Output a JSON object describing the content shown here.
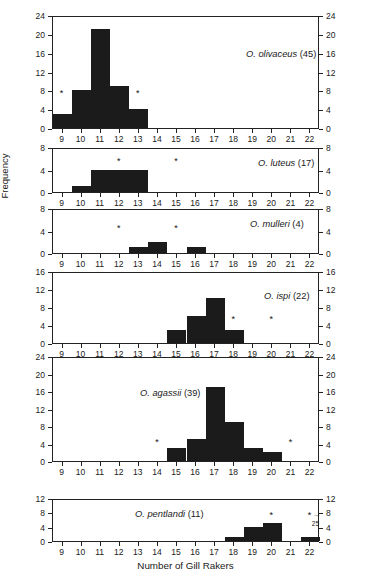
{
  "figure": {
    "xlabel": "Number of Gill Rakers",
    "ylabel": "Frequency"
  },
  "chart_data": {
    "type": "bar",
    "title": "",
    "subtitle": "",
    "xlabel": "Number of Gill Rakers",
    "ylabel": "Frequency",
    "xlim": [
      8.5,
      22.5
    ],
    "x_ticks": [
      9,
      10,
      11,
      12,
      13,
      14,
      15,
      16,
      17,
      18,
      19,
      20,
      21,
      22
    ],
    "grid": false,
    "legend": "none",
    "panel_layout": "6 stacked histogram panels sharing the x-axis; y-axis tick labels mirrored on left and right of each panel",
    "panels": [
      {
        "label": "O. olivaceus",
        "species": "O. olivaceus",
        "n": "(45)",
        "sample_size": 45,
        "ylim": [
          0,
          24
        ],
        "y_ticks": [
          0,
          4,
          8,
          12,
          16,
          20,
          24
        ],
        "categories": [
          9,
          10,
          11,
          12,
          13,
          14,
          15,
          16,
          17,
          18,
          19,
          20,
          21,
          22
        ],
        "values": [
          3,
          8,
          21,
          9,
          4,
          0,
          0,
          0,
          0,
          0,
          0,
          0,
          0,
          0
        ],
        "annotations": [
          {
            "symbol": "*",
            "x": 9,
            "y": 8
          },
          {
            "symbol": "*",
            "x": 13,
            "y": 8
          }
        ]
      },
      {
        "label": "O. luteus",
        "species": "O. luteus",
        "n": "(17)",
        "sample_size": 17,
        "ylim": [
          0,
          8
        ],
        "y_ticks": [
          0,
          4,
          8
        ],
        "categories": [
          9,
          10,
          11,
          12,
          13,
          14,
          15,
          16,
          17,
          18,
          19,
          20,
          21,
          22
        ],
        "values": [
          0,
          1,
          4,
          4,
          4,
          0,
          0,
          0,
          0,
          0,
          0,
          0,
          0,
          0
        ],
        "annotations": [
          {
            "symbol": "*",
            "x": 12,
            "y": 6
          },
          {
            "symbol": "*",
            "x": 15,
            "y": 6
          }
        ]
      },
      {
        "label": "O. mulleri",
        "species": "O. mulleri",
        "n": "(4)",
        "sample_size": 4,
        "ylim": [
          0,
          8
        ],
        "y_ticks": [
          0,
          4,
          8
        ],
        "categories": [
          9,
          10,
          11,
          12,
          13,
          14,
          15,
          16,
          17,
          18,
          19,
          20,
          21,
          22
        ],
        "values": [
          0,
          0,
          0,
          0,
          1,
          2,
          0,
          1,
          0,
          0,
          0,
          0,
          0,
          0
        ],
        "annotations": [
          {
            "symbol": "*",
            "x": 12,
            "y": 5
          },
          {
            "symbol": "*",
            "x": 15,
            "y": 5
          }
        ]
      },
      {
        "label": "O. ispi",
        "species": "O. ispi",
        "n": "(22)",
        "sample_size": 22,
        "ylim": [
          0,
          16
        ],
        "y_ticks": [
          0,
          4,
          8,
          12,
          16
        ],
        "categories": [
          9,
          10,
          11,
          12,
          13,
          14,
          15,
          16,
          17,
          18,
          19,
          20,
          21,
          22
        ],
        "values": [
          0,
          0,
          0,
          0,
          0,
          0,
          3,
          6,
          10,
          3,
          0,
          0,
          0,
          0
        ],
        "annotations": [
          {
            "symbol": "*",
            "x": 18,
            "y": 6
          },
          {
            "symbol": "*",
            "x": 20,
            "y": 6
          }
        ]
      },
      {
        "label": "O. agassii",
        "species": "O. agassii",
        "n": "(39)",
        "sample_size": 39,
        "ylim": [
          0,
          24
        ],
        "y_ticks": [
          0,
          4,
          8,
          12,
          16,
          20,
          24
        ],
        "categories": [
          9,
          10,
          11,
          12,
          13,
          14,
          15,
          16,
          17,
          18,
          19,
          20,
          21,
          22
        ],
        "values": [
          0,
          0,
          0,
          0,
          0,
          0,
          3,
          5,
          17,
          9,
          3,
          2,
          0,
          0
        ],
        "annotations": [
          {
            "symbol": "*",
            "x": 14,
            "y": 5
          },
          {
            "symbol": "*",
            "x": 21,
            "y": 5
          }
        ]
      },
      {
        "label": "O. pentlandi",
        "species": "O. pentlandi",
        "n": "(11)",
        "sample_size": 11,
        "ylim": [
          0,
          12
        ],
        "y_ticks": [
          0,
          4,
          8,
          12
        ],
        "categories": [
          9,
          10,
          11,
          12,
          13,
          14,
          15,
          16,
          17,
          18,
          19,
          20,
          21,
          22
        ],
        "values": [
          0,
          0,
          0,
          0,
          0,
          0,
          0,
          0,
          0,
          1,
          4,
          5,
          0,
          1
        ],
        "annotations": [
          {
            "symbol": "*",
            "x": 20,
            "y": 8
          },
          {
            "symbol": "*",
            "x": 22,
            "y": 8,
            "arrow": "→",
            "offscale_value": "25"
          }
        ]
      }
    ]
  }
}
